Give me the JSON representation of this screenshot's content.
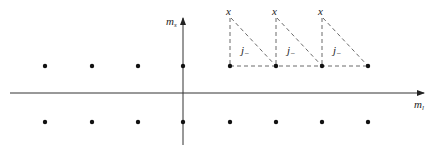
{
  "axes": {
    "x_label": "m",
    "x_sub": "l",
    "y_label": "m",
    "y_sub": "s"
  },
  "lattice": {
    "upper_row_x": [
      45,
      92,
      138,
      183,
      230,
      276,
      322,
      368
    ],
    "lower_row_x": [
      45,
      92,
      138,
      183,
      230,
      276,
      322,
      368
    ],
    "upper_y": 66,
    "lower_y": 122
  },
  "triangles": [
    {
      "top_label": "x",
      "inner_label": "j",
      "inner_sub": "−"
    },
    {
      "top_label": "x",
      "inner_label": "j",
      "inner_sub": "−"
    },
    {
      "top_label": "x",
      "inner_label": "j",
      "inner_sub": "−"
    }
  ],
  "colors": {
    "ink": "#222222",
    "dash": "#444444"
  }
}
